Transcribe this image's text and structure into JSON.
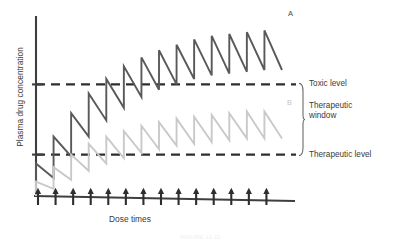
{
  "figure": {
    "caption": "FIGURE 11-11",
    "ylabel": "Plasma drug concentration",
    "xlabel": "Dose times"
  },
  "annotations": {
    "curve_a_label": "A",
    "curve_b_label": "B",
    "toxic_label": "Toxic level",
    "window_label_line1": "Therapeutic",
    "window_label_line2": "window",
    "therapeutic_label": "Therapeutic level"
  },
  "colors": {
    "curve_a": "#595959",
    "curve_b": "#c9c9c9",
    "axis": "#3f3f3f",
    "dashed": "#2e2e2e",
    "text": "#3a3a3a"
  },
  "chart_data": {
    "type": "line",
    "title": "",
    "xlabel": "Dose times",
    "ylabel": "Plasma drug concentration",
    "xlim": [
      0,
      14
    ],
    "ylim": [
      0,
      100
    ],
    "grid": false,
    "legend": "none",
    "axis_ticks_labeled": false,
    "thresholds": [
      {
        "name": "Toxic level",
        "value": 62,
        "style": "dashed"
      },
      {
        "name": "Therapeutic level",
        "value": 23,
        "style": "dashed"
      }
    ],
    "dose_times": [
      0,
      1,
      2,
      3,
      4,
      5,
      6,
      7,
      8,
      9,
      10,
      11,
      12,
      13
    ],
    "series": [
      {
        "name": "A",
        "color": "#595959",
        "peaks": [
          18,
          33,
          46,
          57,
          65,
          72,
          77,
          81,
          84,
          87,
          89,
          90,
          91,
          92
        ],
        "troughs": [
          2,
          10,
          22,
          33,
          42,
          49,
          55,
          59,
          62,
          65,
          67,
          68,
          69,
          70
        ]
      },
      {
        "name": "B",
        "color": "#c9c9c9",
        "peaks": [
          8,
          16,
          23,
          29,
          33,
          36,
          39,
          41,
          43,
          44,
          45,
          46,
          47,
          47
        ],
        "troughs": [
          0,
          4,
          9,
          14,
          18,
          21,
          24,
          26,
          28,
          29,
          30,
          31,
          32,
          32
        ]
      }
    ]
  }
}
